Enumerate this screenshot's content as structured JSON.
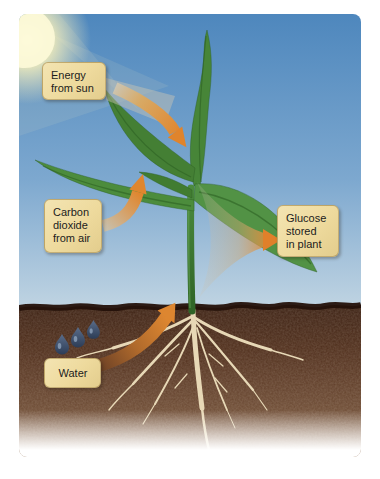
{
  "labels": {
    "energy": {
      "lines": [
        "Energy",
        "from sun"
      ]
    },
    "carbon_dioxide": {
      "lines": [
        "Carbon",
        "dioxide",
        "from air"
      ]
    },
    "glucose": {
      "lines": [
        "Glucose",
        "stored",
        "in plant"
      ]
    },
    "water": {
      "lines": [
        "Water"
      ]
    }
  },
  "icons": {
    "sun": "sun-glow-icon",
    "droplets": "water-droplets-icon",
    "arrows": [
      "energy-arrow",
      "carbon-dioxide-arrow",
      "glucose-arrow",
      "water-arrow"
    ]
  },
  "colors": {
    "sky_top": "#4e87bd",
    "sky_horizon": "#c3d6e3",
    "sun_glow": "#fbf3c2",
    "label_bg": "#eeda9d",
    "label_text": "#1c1c1c",
    "arrow_orange": "#e0842c",
    "leaf_green": "#4c8c3c",
    "stem_green": "#3c7a30",
    "soil_dark": "#3a2013",
    "soil_light": "#8a6a50",
    "soil_edge": "#241109",
    "root_cream": "#e7d8b6",
    "droplet_blue": "#3a4a66"
  }
}
